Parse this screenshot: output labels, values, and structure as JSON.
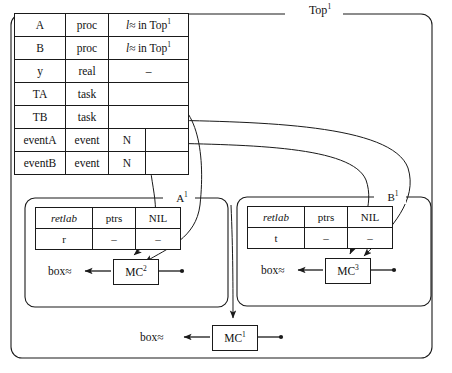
{
  "diagram": {
    "type": "memory-structure-diagram",
    "outer_box": {
      "label": "Top",
      "superscript": "1"
    },
    "symbol_table": {
      "columns": [
        "name",
        "kind",
        "value",
        "extra"
      ],
      "rows": [
        {
          "name": "A",
          "kind": "proc",
          "value_l": "l",
          "value_rest": ". in Top",
          "value_sup": "1",
          "split": false
        },
        {
          "name": "B",
          "kind": "proc",
          "value_l": "l",
          "value_rest": ". in Top",
          "value_sup": "1",
          "split": false
        },
        {
          "name": "y",
          "kind": "real",
          "value_l": "",
          "value_rest": "–",
          "value_sup": "",
          "split": false
        },
        {
          "name": "TA",
          "kind": "task",
          "value_l": "",
          "value_rest": "",
          "value_sup": "",
          "split": false
        },
        {
          "name": "TB",
          "kind": "task",
          "value_l": "",
          "value_rest": "",
          "value_sup": "",
          "split": false
        },
        {
          "name": "eventA",
          "kind": "event",
          "value_l": "",
          "value_rest": "N",
          "value_sup": "",
          "split": true
        },
        {
          "name": "eventB",
          "kind": "event",
          "value_l": "",
          "value_rest": "N",
          "value_sup": "",
          "split": true
        }
      ]
    },
    "inner_boxes": [
      {
        "label": "A",
        "superscript": "1",
        "table": {
          "headers": [
            "retlab",
            "ptrs",
            "NIL"
          ],
          "row": [
            "r",
            "–",
            "–"
          ]
        },
        "box_label": "box",
        "mc": {
          "label": "MC",
          "superscript": "2"
        }
      },
      {
        "label": "B",
        "superscript": "1",
        "table": {
          "headers": [
            "retlab",
            "ptrs",
            "NIL"
          ],
          "row": [
            "t",
            "–",
            "–"
          ]
        },
        "box_label": "box",
        "mc": {
          "label": "MC",
          "superscript": "3"
        }
      }
    ],
    "bottom": {
      "box_label": "box",
      "mc": {
        "label": "MC",
        "superscript": "1"
      }
    },
    "colors": {
      "stroke": "#1a1a1a",
      "background": "#ffffff"
    }
  }
}
